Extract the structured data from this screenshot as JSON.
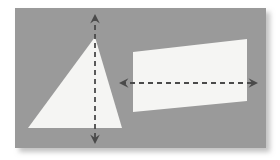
{
  "figure": {
    "canvas": {
      "width": 280,
      "height": 160,
      "background": "#ffffff"
    },
    "panel": {
      "name": "gray-backdrop-panel",
      "x": 15,
      "y": 8,
      "width": 251,
      "height": 140,
      "fill": "#9a9a9a",
      "shadow_color": "#cfcfcf",
      "shadow_offset_x": 4,
      "shadow_offset_y": 4,
      "shadow_blur": 4
    },
    "shapes": [
      {
        "name": "triangle",
        "kind": "triangle",
        "fill": "#f5f5f3",
        "points": "95,37 122,128 28,128",
        "apex": {
          "x": 95,
          "y": 37
        },
        "base_left": {
          "x": 28,
          "y": 128
        },
        "base_right": {
          "x": 122,
          "y": 128
        }
      },
      {
        "name": "quadrilateral",
        "kind": "quadrilateral",
        "fill": "#f5f5f3",
        "points": "133,52 247,39 247,101 133,112",
        "top_left": {
          "x": 133,
          "y": 52
        },
        "top_right": {
          "x": 247,
          "y": 39
        },
        "bottom_right": {
          "x": 247,
          "y": 101
        },
        "bottom_left": {
          "x": 133,
          "y": 112
        }
      }
    ],
    "dimension_arrows": [
      {
        "name": "vertical-height-arrow",
        "orientation": "vertical",
        "color": "#4a4a4a",
        "stroke_width": 1.8,
        "dash_pattern": "5 4",
        "x1": 95,
        "y1": 16,
        "x2": 95,
        "y2": 142,
        "tip_start": {
          "x": 95,
          "y": 14
        },
        "tip_end": {
          "x": 95,
          "y": 144
        },
        "double_headed": true
      },
      {
        "name": "horizontal-width-arrow",
        "orientation": "horizontal",
        "color": "#4a4a4a",
        "stroke_width": 1.8,
        "dash_pattern": "5 4",
        "x1": 121,
        "y1": 83,
        "x2": 256,
        "y2": 83,
        "tip_start": {
          "x": 119,
          "y": 83
        },
        "tip_end": {
          "x": 258,
          "y": 83
        },
        "double_headed": true
      }
    ],
    "colors": {
      "panel_gray": "#9a9a9a",
      "shape_white": "#f5f5f3",
      "arrow_dark": "#4a4a4a",
      "page_white": "#ffffff",
      "shadow_gray": "#cfcfcf"
    }
  }
}
